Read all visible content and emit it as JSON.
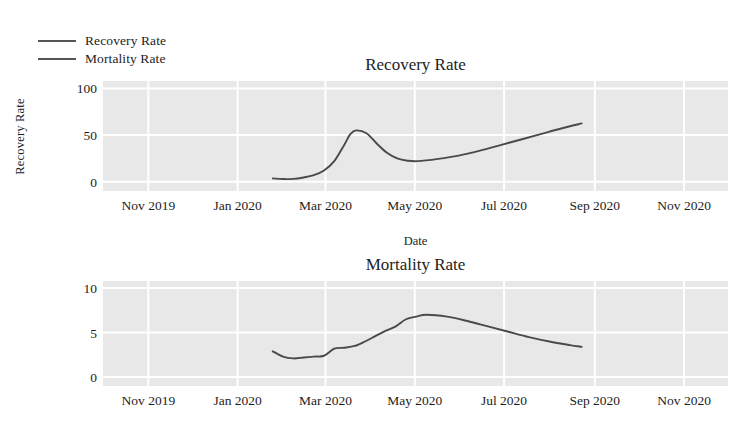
{
  "legend": {
    "position": "top-left",
    "items": [
      {
        "label": "Recovery Rate",
        "color": "#555555"
      },
      {
        "label": "Mortality Rate",
        "color": "#555555"
      }
    ]
  },
  "axis_label_x": "Date",
  "axis_label_y": "Recovery Rate",
  "colors": {
    "line": "#4a4a4a",
    "plot_background": "#e8e8e8",
    "gridline": "#ffffff",
    "text": "#1d1d1d"
  },
  "chart_data": [
    {
      "type": "line",
      "id": "recovery",
      "title": "Recovery Rate",
      "xlabel": "Date",
      "ylabel": "Recovery Rate",
      "grid": true,
      "legend_position": "top-left",
      "ylim": [
        -10,
        108
      ],
      "yticks": [
        0,
        50,
        100
      ],
      "xlim": [
        "2019-10-01",
        "2020-12-01"
      ],
      "xticks": [
        "Nov 2019",
        "Jan 2020",
        "Mar 2020",
        "May 2020",
        "Jul 2020",
        "Sep 2020",
        "Nov 2020"
      ],
      "series": [
        {
          "name": "Recovery Rate",
          "color": "#4a4a4a",
          "x": [
            "2020-01-25",
            "2020-02-01",
            "2020-02-08",
            "2020-02-15",
            "2020-02-22",
            "2020-02-29",
            "2020-03-07",
            "2020-03-14",
            "2020-03-18",
            "2020-03-22",
            "2020-03-29",
            "2020-04-05",
            "2020-04-12",
            "2020-04-19",
            "2020-04-26",
            "2020-05-03",
            "2020-05-17",
            "2020-05-31",
            "2020-06-14",
            "2020-06-28",
            "2020-07-12",
            "2020-07-26",
            "2020-08-09",
            "2020-08-23"
          ],
          "y": [
            3.5,
            2.8,
            3.0,
            4.5,
            7.0,
            12.0,
            22.0,
            40.0,
            51.0,
            55.0,
            52.0,
            41.0,
            31.0,
            25.0,
            22.5,
            22.0,
            24.5,
            28.0,
            33.0,
            39.0,
            45.0,
            51.0,
            57.0,
            62.5
          ]
        }
      ]
    },
    {
      "type": "line",
      "id": "mortality",
      "title": "Mortality Rate",
      "xlabel": "Date",
      "ylabel": "Mortality Rate",
      "grid": true,
      "ylim": [
        -1,
        10.8
      ],
      "yticks": [
        0,
        5,
        10
      ],
      "xlim": [
        "2019-10-01",
        "2020-12-01"
      ],
      "xticks": [
        "Nov 2019",
        "Jan 2020",
        "Mar 2020",
        "May 2020",
        "Jul 2020",
        "Sep 2020",
        "Nov 2020"
      ],
      "series": [
        {
          "name": "Mortality Rate",
          "color": "#4a4a4a",
          "x": [
            "2020-01-25",
            "2020-02-01",
            "2020-02-08",
            "2020-02-15",
            "2020-02-22",
            "2020-02-29",
            "2020-03-07",
            "2020-03-14",
            "2020-03-21",
            "2020-03-28",
            "2020-04-04",
            "2020-04-11",
            "2020-04-18",
            "2020-04-25",
            "2020-05-02",
            "2020-05-09",
            "2020-05-23",
            "2020-06-06",
            "2020-06-20",
            "2020-07-04",
            "2020-07-18",
            "2020-08-01",
            "2020-08-15",
            "2020-08-23"
          ],
          "y": [
            2.9,
            2.3,
            2.1,
            2.2,
            2.3,
            2.4,
            3.2,
            3.3,
            3.5,
            4.0,
            4.6,
            5.2,
            5.7,
            6.5,
            6.8,
            7.0,
            6.8,
            6.3,
            5.7,
            5.1,
            4.5,
            4.0,
            3.6,
            3.4
          ]
        }
      ]
    }
  ]
}
